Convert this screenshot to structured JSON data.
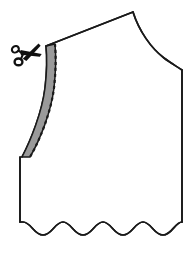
{
  "figure": {
    "title": "Sewing pattern bodice front with neckline seam allowance trim guide",
    "caption": "",
    "width": 194,
    "height": 254,
    "background_color": "#ffffff"
  },
  "colors": {
    "outline": "#1a1a1a",
    "seam_allowance_fill": "#9a9a9a",
    "stitch_line": "#1a1a1a",
    "scissors": "#111111",
    "paper": "#ffffff"
  },
  "icons": {
    "scissors": {
      "name": "scissors-icon",
      "label": "Cut here",
      "x": 12,
      "y": 40,
      "width": 30,
      "height": 26,
      "rotation_deg": -18
    }
  },
  "geometry": {
    "shoulder_peak": {
      "x": 133,
      "y": 12
    },
    "neckline_top": {
      "x": 46,
      "y": 46
    },
    "neckline_bottom": {
      "x": 22,
      "y": 157
    },
    "armhole_end": {
      "x": 182,
      "y": 70
    },
    "side_seam_bottom": {
      "x": 182,
      "y": 228
    },
    "left_edge_bottom": {
      "x": 20,
      "y": 228
    },
    "seam_allowance_width_px": 9,
    "wave_count": 5,
    "wave_amplitude_px": 7
  },
  "labels": {
    "outline_path": "bodice-outline",
    "seam_allowance": "neckline-seam-allowance",
    "stitch_line": "neckline-stitching-line",
    "raw_edge": "raw-edge-wave",
    "shoulder_line": "shoulder-seam",
    "armhole_line": "armhole-curve",
    "side_seam": "side-seam",
    "center_front": "center-front-edge"
  }
}
